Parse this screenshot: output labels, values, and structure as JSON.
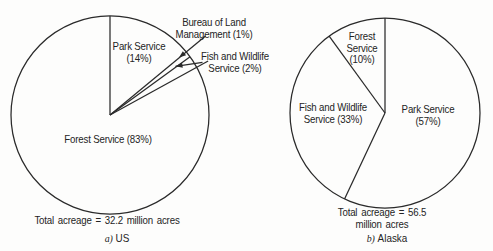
{
  "figure": {
    "background": "#fdfdfc",
    "ink": "#242424"
  },
  "chart_data": [
    {
      "type": "pie",
      "id": "us",
      "caption_prefix": "a)",
      "caption": "US",
      "total_label": "Total acreage  =  32.2 million acres",
      "total_acreage_million_acres": 32.2,
      "start": "top",
      "direction": "clockwise",
      "legend_position": "labels-on-chart",
      "slices": [
        {
          "name": "Park Service",
          "pct": 14,
          "label": "Park Service\n(14%)"
        },
        {
          "name": "Bureau of Land Management",
          "pct": 1,
          "label": "Bureau of Land\nManagement (1%)"
        },
        {
          "name": "Fish and Wildlife Service",
          "pct": 2,
          "label": "Fish and Wildlife\nService (2%)"
        },
        {
          "name": "Forest Service",
          "pct": 83,
          "label": "Forest Service (83%)"
        }
      ]
    },
    {
      "type": "pie",
      "id": "alaska",
      "caption_prefix": "b)",
      "caption": "Alaska",
      "total_label": "Total acreage  =  56.5 million acres",
      "total_acreage_million_acres": 56.5,
      "start": "top",
      "direction": "clockwise",
      "legend_position": "labels-on-chart",
      "slices": [
        {
          "name": "Park Service",
          "pct": 57,
          "label": "Park Service (57%)"
        },
        {
          "name": "Fish and Wildlife Service",
          "pct": 33,
          "label": "Fish and Wildlife\nService (33%)"
        },
        {
          "name": "Forest Service",
          "pct": 10,
          "label": "Forest\nService\n(10%)"
        }
      ]
    }
  ]
}
